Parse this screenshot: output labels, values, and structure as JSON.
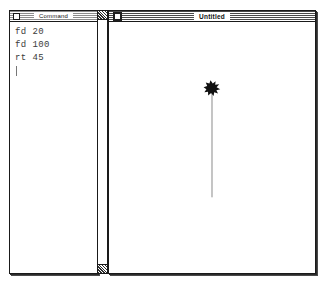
{
  "app": {
    "name": "Logo",
    "background_color": "#ffffff",
    "ink_color": "#1a1a1a"
  },
  "command_window": {
    "title": "Command",
    "close_box_label": "close",
    "lines": [
      "fd 20",
      "fd 100",
      "rt 45"
    ],
    "caret_visible": true,
    "text_color": "#3b3b3b"
  },
  "scrollbar": {
    "up_arrow_label": "scroll-up",
    "down_arrow_label": "scroll-down",
    "orientation": "vertical"
  },
  "graphics_window": {
    "title": "Untitled",
    "close_box_label": "close",
    "turtle": {
      "x": 103,
      "y": 67,
      "heading_degrees": 45,
      "color": "#111111",
      "shape": "turtle"
    },
    "drawing": {
      "stroke_color": "#8a8a8a",
      "paths": [
        {
          "label": "turtle-trail",
          "x1": 103,
          "y1": 70,
          "x2": 103,
          "y2": 176
        }
      ]
    }
  }
}
